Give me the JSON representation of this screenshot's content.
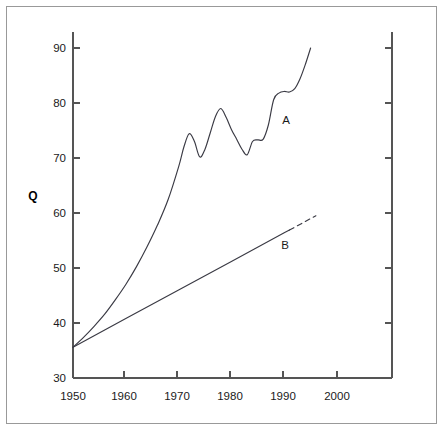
{
  "chart_data": {
    "type": "line",
    "title": "",
    "subtitle": "",
    "xlabel": "",
    "ylabel": "Q",
    "xlim": [
      1950,
      2006
    ],
    "ylim": [
      30,
      92
    ],
    "grid": false,
    "legend_position": "inline-annotation",
    "x_ticks": [
      1950,
      1960,
      1970,
      1980,
      1990,
      2000
    ],
    "x_tick_labels": [
      "1950",
      "1960",
      "1970",
      "1980",
      "1990",
      "2000"
    ],
    "y_ticks": [
      30,
      40,
      50,
      60,
      70,
      80,
      90
    ],
    "y_tick_labels": [
      "30",
      "40",
      "50",
      "60",
      "70",
      "80",
      "90"
    ],
    "annotations": [
      {
        "text": "A",
        "x": 1990.0,
        "y": 78.0
      },
      {
        "text": "B",
        "x": 1989.5,
        "y": 55.5
      }
    ],
    "series": [
      {
        "name": "A",
        "style": "solid",
        "x": [
          1950,
          1952,
          1954,
          1956,
          1958,
          1960,
          1962,
          1964,
          1966,
          1968,
          1970,
          1971,
          1972,
          1973,
          1974,
          1975,
          1976,
          1977,
          1978,
          1979,
          1980,
          1981,
          1982,
          1983,
          1984,
          1985,
          1986,
          1987,
          1988,
          1989,
          1990,
          1991,
          1992,
          1993,
          1994,
          1995
        ],
        "y": [
          35.6,
          37.4,
          39.4,
          41.6,
          44.2,
          47.0,
          50.2,
          53.8,
          57.8,
          62.4,
          68.4,
          72.0,
          74.4,
          73.0,
          70.2,
          71.6,
          74.6,
          77.6,
          79.0,
          77.4,
          75.2,
          73.4,
          71.6,
          70.6,
          73.0,
          73.3,
          73.4,
          76.0,
          80.6,
          81.8,
          82.1,
          82.0,
          82.6,
          84.4,
          87.0,
          90.0
        ]
      },
      {
        "name": "B",
        "style": "solid-then-dashed",
        "dash_start_year": 1991,
        "x": [
          1950,
          1960,
          1970,
          1980,
          1990,
          1991,
          1996
        ],
        "y": [
          35.6,
          40.8,
          46.0,
          51.2,
          56.4,
          56.9,
          59.5
        ]
      }
    ]
  },
  "figure": {
    "border_color": "#999999",
    "line_color": "#3a3a44",
    "axis_color": "#555555",
    "background": "#ffffff"
  }
}
